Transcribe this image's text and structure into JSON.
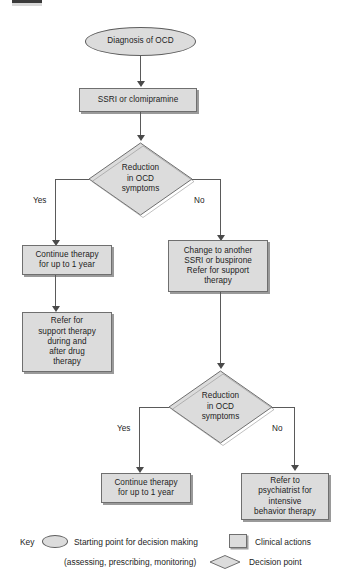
{
  "figure": {
    "type": "flowchart",
    "title_visible": false,
    "background_color": "#ffffff",
    "node_fill": "#dcdcdc",
    "node_border": "#6f6f6f",
    "connector_color": "#5a5a5a",
    "text_color": "#1d1d1d"
  },
  "nodes": {
    "start": {
      "shape": "oval",
      "label": "Diagnosis of OCD"
    },
    "first_treatment": {
      "shape": "box",
      "label": "SSRI or clomipramine"
    },
    "decision1": {
      "shape": "diamond",
      "label": "Reduction\nin OCD\nsymptoms"
    },
    "continue_therapy_1": {
      "shape": "box",
      "label": "Continue therapy\nfor up to 1 year"
    },
    "refer_support_1": {
      "shape": "box",
      "label": "Refer for\nsupport therapy\nduring and\nafter drug\ntherapy"
    },
    "change_treatment": {
      "shape": "box",
      "label": "Change to another\nSSRI or buspirone\nRefer for support\ntherapy"
    },
    "decision2": {
      "shape": "diamond",
      "label": "Reduction\nin OCD\nsymptoms"
    },
    "continue_therapy_2": {
      "shape": "box",
      "label": "Continue therapy\nfor up to 1 year"
    },
    "refer_psychiatrist": {
      "shape": "box",
      "label": "Refer to\npsychiatrist for\nintensive\nbehavior therapy"
    }
  },
  "branch_labels": {
    "decision1_yes": "Yes",
    "decision1_no": "No",
    "decision2_yes": "Yes",
    "decision2_no": "No"
  },
  "legend": {
    "key_label": "Key",
    "items": [
      {
        "shape": "oval",
        "label_line1": "Starting point for decision making",
        "label_line2": "(assessing, prescribing, monitoring)"
      },
      {
        "shape": "box",
        "label": "Clinical actions"
      },
      {
        "shape": "diamond",
        "label": "Decision point"
      }
    ]
  }
}
